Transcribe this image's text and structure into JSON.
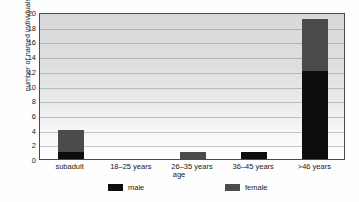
{
  "chart_data": {
    "type": "bar",
    "title": "",
    "subtitle": "",
    "xlabel": "age",
    "ylabel": "number of named individuals",
    "categories": [
      "subadult",
      "18–25 years",
      "26–35 years",
      "36–45 years",
      ">46 years"
    ],
    "series": [
      {
        "name": "male",
        "color": "#0d0d0d",
        "values": [
          1,
          0,
          0,
          1,
          12
        ]
      },
      {
        "name": "female",
        "color": "#4b4b4b",
        "values": [
          3,
          0,
          1,
          0,
          7
        ]
      }
    ],
    "stacked": true,
    "stack_totals": [
      4,
      0,
      1,
      1,
      19
    ],
    "ylim": [
      0,
      20
    ],
    "ytick_values": [
      0,
      2,
      4,
      6,
      8,
      10,
      12,
      14,
      16,
      18,
      20
    ],
    "ytick_labels": [
      "0",
      "2",
      "4",
      "6",
      "8",
      "10",
      "12",
      "14",
      "16",
      "18",
      "20"
    ],
    "grid": true,
    "grid_axis": "y",
    "legend_position": "bottom",
    "legend_entries": [
      "male",
      "female"
    ]
  },
  "colors": {
    "male": "#0d0d0d",
    "female": "#4b4b4b",
    "frame": "#4a4a4a",
    "text": "#1a1a1a",
    "gridline": "#787878"
  }
}
